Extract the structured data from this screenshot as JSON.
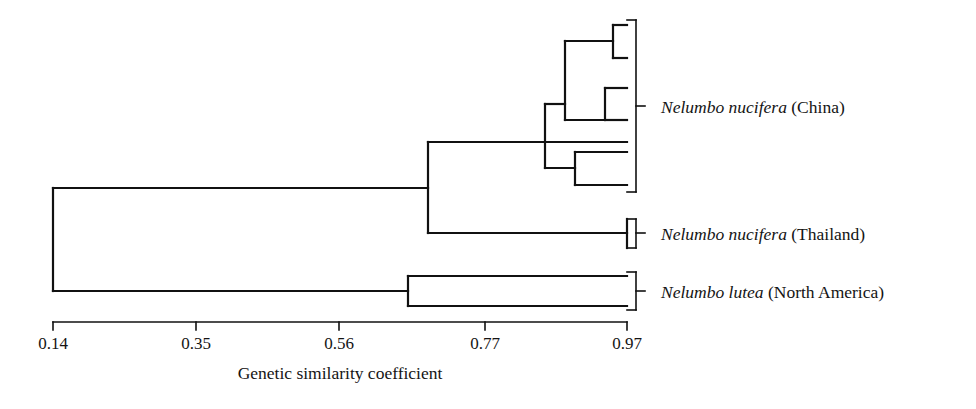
{
  "figure": {
    "type": "dendrogram",
    "line_color": "#111111",
    "background": "#ffffff"
  },
  "axis": {
    "title": "Genetic similarity coefficient",
    "ticks": [
      {
        "value": "0.14",
        "x": 53
      },
      {
        "value": "0.35",
        "x": 196
      },
      {
        "value": "0.56",
        "x": 339
      },
      {
        "value": "0.77",
        "x": 485
      },
      {
        "value": "0.97",
        "x": 627
      }
    ],
    "line_y": 322,
    "tick_length": 8,
    "x_min": 53,
    "x_max": 627,
    "v_min": 0.14,
    "v_max": 0.97
  },
  "groups": [
    {
      "id": "china",
      "sci_name": "Nelumbo nucifera",
      "region": " (China)",
      "bracket": {
        "x": 636,
        "top": 20,
        "bottom": 192,
        "tick_y": 106,
        "arm": 9
      },
      "label": {
        "x": 661,
        "y": 99
      },
      "n_tips": 6
    },
    {
      "id": "thailand",
      "sci_name": "Nelumbo nucifera",
      "region": " (Thailand)",
      "bracket": {
        "x": 636,
        "top": 219,
        "bottom": 248,
        "tick_y": 233,
        "arm": 9
      },
      "label": {
        "x": 661,
        "y": 226
      },
      "n_tips": 1
    },
    {
      "id": "lutea",
      "sci_name": "Nelumbo lutea",
      "region": " (North America)",
      "bracket": {
        "x": 636,
        "top": 272,
        "bottom": 310,
        "tick_y": 291,
        "arm": 9
      },
      "label": {
        "x": 661,
        "y": 284
      },
      "n_tips": 2
    }
  ],
  "chart_data": {
    "type": "dendrogram",
    "title": "",
    "xlabel": "Genetic similarity coefficient",
    "ylabel": "",
    "xlim": [
      0.14,
      0.97
    ],
    "x_axis_direction": "increasing-similarity-to-the-right",
    "tick_values": [
      0.14,
      0.35,
      0.56,
      0.77,
      0.97
    ],
    "grid": false,
    "legend": "none",
    "leaf_labels": [
      "Nelumbo nucifera (China)",
      "Nelumbo nucifera (Thailand)",
      "Nelumbo lutea (North America)"
    ],
    "leaves": [
      {
        "id": "C1",
        "group": "china",
        "y": 25,
        "tip_similarity": 0.97
      },
      {
        "id": "C2",
        "group": "china",
        "y": 58,
        "tip_similarity": 0.97
      },
      {
        "id": "C3",
        "group": "china",
        "y": 88,
        "tip_similarity": 0.97
      },
      {
        "id": "C4",
        "group": "china",
        "y": 120,
        "tip_similarity": 0.97
      },
      {
        "id": "C5",
        "group": "china",
        "y": 152,
        "tip_similarity": 0.97
      },
      {
        "id": "C6",
        "group": "china",
        "y": 185,
        "tip_similarity": 0.97
      },
      {
        "id": "T1",
        "group": "thailand",
        "y": 233,
        "tip_similarity": 0.97
      },
      {
        "id": "L1",
        "group": "lutea",
        "y": 276,
        "tip_similarity": 0.97
      },
      {
        "id": "L2",
        "group": "lutea",
        "y": 306,
        "tip_similarity": 0.97
      }
    ],
    "nodes": [
      {
        "id": "n_root",
        "similarity": 0.14,
        "x": 53,
        "children_y": [
          188,
          291
        ],
        "merge_y": 239
      },
      {
        "id": "n_nucifera",
        "similarity": 0.68,
        "x": 428,
        "children_y": [
          142,
          233
        ],
        "merge_y": 188
      },
      {
        "id": "n_china",
        "similarity": 0.81,
        "x": 545,
        "children_y": [
          104,
          168
        ],
        "merge_y": 142
      },
      {
        "id": "n_chinaA",
        "similarity": 0.84,
        "x": 565,
        "children_y": [
          41,
          120
        ],
        "merge_y": 104
      },
      {
        "id": "n_cherry1",
        "similarity": 0.88,
        "x": 568,
        "children_y": [
          41,
          88
        ],
        "merge_y": 64
      },
      {
        "id": "n_cherry1b",
        "similarity": 0.945,
        "x": 613,
        "children_y": [
          25,
          58
        ],
        "merge_y": 41
      },
      {
        "id": "n_cherry2",
        "similarity": 0.93,
        "x": 605,
        "children_y": [
          88,
          120
        ],
        "merge_y": 104
      },
      {
        "id": "n_cherry3",
        "similarity": 0.895,
        "x": 575,
        "children_y": [
          152,
          185
        ],
        "merge_y": 168
      },
      {
        "id": "n_lutea",
        "similarity": 0.65,
        "x": 408,
        "children_y": [
          276,
          306
        ],
        "merge_y": 291
      }
    ],
    "branches_note": "Horizontal branch ends terminate at x=627 (similarity 0.97) for all terminal tips."
  },
  "lines": {
    "stroke_width": 2.2,
    "segments": [
      {
        "name": "root-vertical",
        "x1": 53,
        "y1": 188,
        "x2": 53,
        "y2": 291
      },
      {
        "name": "root-to-nucifera",
        "x1": 53,
        "y1": 188,
        "x2": 428,
        "y2": 188
      },
      {
        "name": "root-to-lutea",
        "x1": 53,
        "y1": 291,
        "x2": 408,
        "y2": 291
      },
      {
        "name": "nucifera-vertical",
        "x1": 428,
        "y1": 142,
        "x2": 428,
        "y2": 233
      },
      {
        "name": "nucifera-to-china",
        "x1": 428,
        "y1": 142,
        "x2": 545,
        "y2": 142
      },
      {
        "name": "thailand-branch",
        "x1": 428,
        "y1": 233,
        "x2": 627,
        "y2": 233
      },
      {
        "name": "thailand-tip-bar",
        "x1": 627,
        "y1": 219,
        "x2": 627,
        "y2": 248
      },
      {
        "name": "china-vertical",
        "x1": 545,
        "y1": 104,
        "x2": 545,
        "y2": 168
      },
      {
        "name": "china-up-horiz",
        "x1": 545,
        "y1": 104,
        "x2": 565,
        "y2": 104
      },
      {
        "name": "china-dn-horiz",
        "x1": 545,
        "y1": 168,
        "x2": 575,
        "y2": 168
      },
      {
        "name": "chinaA-vertical",
        "x1": 565,
        "y1": 41,
        "x2": 565,
        "y2": 120
      },
      {
        "name": "chinaA-up-horiz",
        "x1": 565,
        "y1": 41,
        "x2": 613,
        "y2": 41
      },
      {
        "name": "chinaA-dn-horiz",
        "x1": 565,
        "y1": 120,
        "x2": 605,
        "y2": 120
      },
      {
        "name": "cherry1b-vertical",
        "x1": 613,
        "y1": 25,
        "x2": 613,
        "y2": 58
      },
      {
        "name": "tip-C1",
        "x1": 613,
        "y1": 25,
        "x2": 627,
        "y2": 25
      },
      {
        "name": "tip-C2",
        "x1": 613,
        "y1": 58,
        "x2": 627,
        "y2": 58
      },
      {
        "name": "cherry2-vertical",
        "x1": 605,
        "y1": 88,
        "x2": 605,
        "y2": 120
      },
      {
        "name": "tip-C3",
        "x1": 605,
        "y1": 88,
        "x2": 627,
        "y2": 88
      },
      {
        "name": "tip-C4",
        "x1": 605,
        "y1": 120,
        "x2": 627,
        "y2": 120
      },
      {
        "name": "tip-C5-branch",
        "x1": 545,
        "y1": 142,
        "x2": 627,
        "y2": 142
      },
      {
        "name": "cherry3-vertical",
        "x1": 575,
        "y1": 152,
        "x2": 575,
        "y2": 185
      },
      {
        "name": "tip-C6a",
        "x1": 575,
        "y1": 152,
        "x2": 627,
        "y2": 152
      },
      {
        "name": "tip-C6b",
        "x1": 575,
        "y1": 185,
        "x2": 627,
        "y2": 185
      },
      {
        "name": "lutea-vertical",
        "x1": 408,
        "y1": 276,
        "x2": 408,
        "y2": 306
      },
      {
        "name": "tip-L1",
        "x1": 408,
        "y1": 276,
        "x2": 627,
        "y2": 276
      },
      {
        "name": "tip-L2",
        "x1": 408,
        "y1": 306,
        "x2": 627,
        "y2": 306
      }
    ]
  }
}
